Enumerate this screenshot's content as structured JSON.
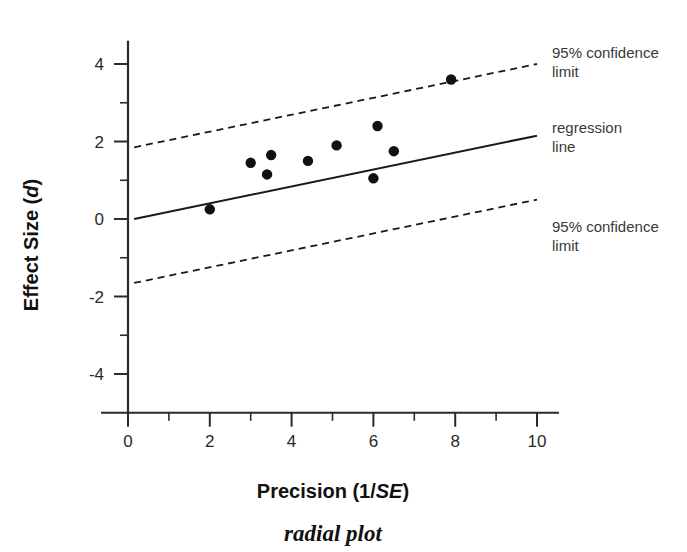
{
  "figure": {
    "caption": "radial plot",
    "background_color": "#ffffff",
    "foreground_color": "#111111"
  },
  "annotations": {
    "upper_ci": {
      "line1": "95% confidence",
      "line2": "limit"
    },
    "regression": {
      "line1": "regression",
      "line2": "line"
    },
    "lower_ci": {
      "line1": "95% confidence",
      "line2": "limit"
    }
  },
  "chart_data": {
    "type": "scatter",
    "title": "radial plot",
    "xlabel": "Precision (1/SE)",
    "xlabel_parts": {
      "plain": "Precision (1/",
      "italic": "SE",
      "tail": ")"
    },
    "ylabel": "Effect Size (d)",
    "ylabel_parts": {
      "plain": "Effect Size (",
      "italic": "d",
      "tail": ")"
    },
    "xlim": [
      0,
      10
    ],
    "ylim": [
      -5,
      4.6
    ],
    "xticks": [
      0,
      2,
      4,
      6,
      8,
      10
    ],
    "xtick_labels": [
      "0",
      "2",
      "4",
      "6",
      "8",
      "10"
    ],
    "x_minor_ticks": [
      1,
      3,
      5,
      7,
      9
    ],
    "yticks": [
      4,
      2,
      0,
      -2,
      -4
    ],
    "ytick_labels": [
      "4",
      "2",
      "0",
      "-2",
      "-4"
    ],
    "y_minor_ticks": [
      3,
      1,
      -1,
      -3
    ],
    "grid": false,
    "legend": "annotations at right of plot",
    "points": [
      {
        "x": 2.0,
        "y": 0.25
      },
      {
        "x": 3.0,
        "y": 1.45
      },
      {
        "x": 3.4,
        "y": 1.15
      },
      {
        "x": 3.5,
        "y": 1.65
      },
      {
        "x": 4.4,
        "y": 1.5
      },
      {
        "x": 5.1,
        "y": 1.9
      },
      {
        "x": 6.0,
        "y": 1.05
      },
      {
        "x": 6.1,
        "y": 2.4
      },
      {
        "x": 6.5,
        "y": 1.75
      },
      {
        "x": 7.9,
        "y": 3.6
      }
    ],
    "lines": [
      {
        "name": "upper 95% confidence limit",
        "style": "dashed",
        "x": [
          0.15,
          10.0
        ],
        "y": [
          1.85,
          4.0
        ]
      },
      {
        "name": "regression line",
        "style": "solid",
        "x": [
          0.15,
          10.0
        ],
        "y": [
          0.0,
          2.15
        ]
      },
      {
        "name": "lower 95% confidence limit",
        "style": "dashed",
        "x": [
          0.15,
          10.0
        ],
        "y": [
          -1.65,
          0.5
        ]
      }
    ]
  }
}
